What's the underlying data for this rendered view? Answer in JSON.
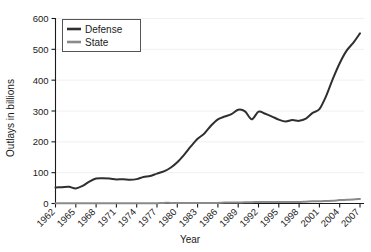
{
  "chart_data": {
    "type": "line",
    "title": "",
    "xlabel": "Year",
    "ylabel": "Outlays in billions",
    "xlim": [
      1962,
      2007
    ],
    "ylim": [
      0,
      600
    ],
    "yticks": [
      0,
      100,
      200,
      300,
      400,
      500,
      600
    ],
    "xticks": [
      1962,
      1965,
      1968,
      1971,
      1974,
      1977,
      1980,
      1983,
      1986,
      1989,
      1992,
      1995,
      1998,
      2001,
      2004,
      2007
    ],
    "grid": true,
    "legend_position": "top-left",
    "x": [
      1962,
      1963,
      1964,
      1965,
      1966,
      1967,
      1968,
      1969,
      1970,
      1971,
      1972,
      1973,
      1974,
      1975,
      1976,
      1977,
      1978,
      1979,
      1980,
      1981,
      1982,
      1983,
      1984,
      1985,
      1986,
      1987,
      1988,
      1989,
      1990,
      1991,
      1992,
      1993,
      1994,
      1995,
      1996,
      1997,
      1998,
      1999,
      2000,
      2001,
      2002,
      2003,
      2004,
      2005,
      2006,
      2007
    ],
    "series": [
      {
        "name": "Defense",
        "color": "#2f2f2f",
        "values": [
          52,
          53,
          54,
          49,
          57,
          71,
          81,
          82,
          81,
          78,
          79,
          77,
          79,
          86,
          89,
          97,
          104,
          116,
          134,
          158,
          185,
          210,
          227,
          253,
          273,
          282,
          290,
          304,
          299,
          273,
          298,
          291,
          282,
          272,
          266,
          271,
          268,
          275,
          294,
          306,
          349,
          405,
          455,
          495,
          521,
          552
        ]
      },
      {
        "name": "State",
        "color": "#8a8a8a",
        "values": [
          1,
          1,
          1,
          1,
          1,
          1,
          1,
          1,
          1,
          1,
          1,
          1,
          1,
          1,
          1,
          1,
          2,
          2,
          2,
          2,
          2,
          2,
          2,
          2,
          2,
          3,
          3,
          3,
          4,
          4,
          5,
          5,
          5,
          5,
          5,
          5,
          5,
          6,
          7,
          7,
          8,
          9,
          11,
          12,
          13,
          15
        ]
      }
    ]
  },
  "axes": {
    "y_title": "Outlays in billions",
    "x_title": "Year",
    "y_tick_labels": [
      "0",
      "100",
      "200",
      "300",
      "400",
      "500",
      "600"
    ],
    "x_tick_labels": [
      "1962",
      "1965",
      "1968",
      "1971",
      "1974",
      "1977",
      "1980",
      "1983",
      "1986",
      "1989",
      "1992",
      "1995",
      "1998",
      "2001",
      "2004",
      "2007"
    ]
  },
  "legend": {
    "entries": [
      {
        "label": "Defense",
        "color": "#2f2f2f"
      },
      {
        "label": "State",
        "color": "#8a8a8a"
      }
    ]
  },
  "colors": {
    "background": "#ffffff",
    "axis": "#1a1a1a",
    "grid": "#f0f0f0",
    "defense": "#2f2f2f",
    "state": "#8a8a8a"
  }
}
